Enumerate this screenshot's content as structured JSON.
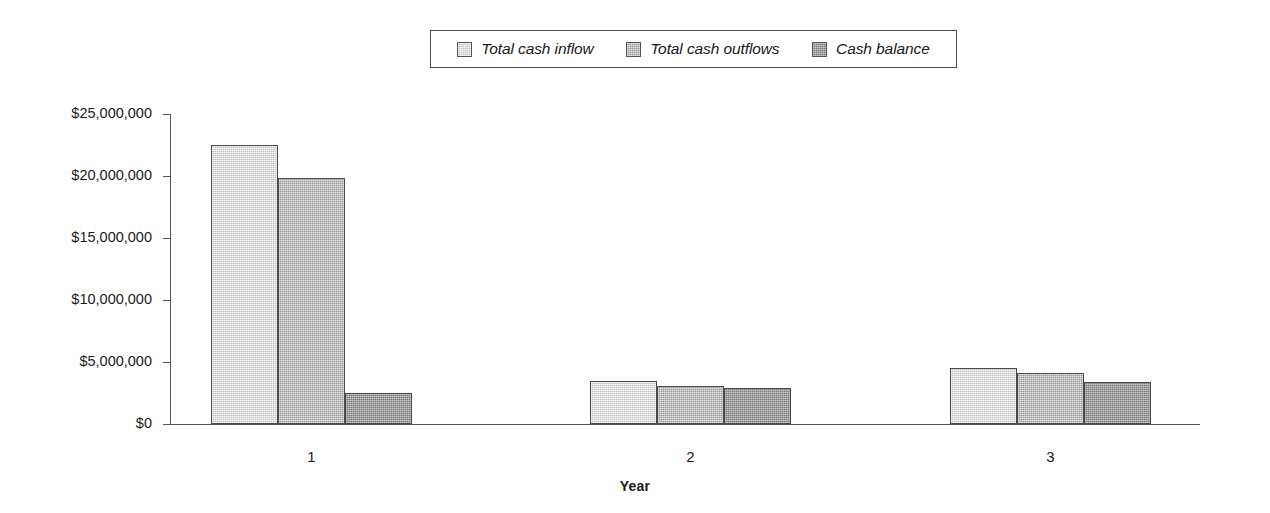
{
  "chart_data": {
    "type": "bar",
    "title": "",
    "xlabel": "Year",
    "ylabel": "",
    "categories": [
      "1",
      "2",
      "3"
    ],
    "series": [
      {
        "name": "Total cash inflow",
        "color": "#d5d5d5",
        "values": [
          22500000,
          3500000,
          4500000
        ]
      },
      {
        "name": "Total cash outflows",
        "color": "#b1b1b1",
        "values": [
          19800000,
          3100000,
          4100000
        ]
      },
      {
        "name": "Cash balance",
        "color": "#909090",
        "values": [
          2500000,
          2900000,
          3400000
        ]
      }
    ],
    "ylim": [
      0,
      25000000
    ],
    "ytick_values": [
      0,
      5000000,
      10000000,
      15000000,
      20000000,
      25000000
    ],
    "ytick_labels": [
      "$0",
      "$5,000,000",
      "$10,000,000",
      "$15,000,000",
      "$20,000,000",
      "$25,000,000"
    ],
    "grid": false,
    "legend_position": "top-center",
    "legend_border": true,
    "axis_color": "#555555",
    "bar_border_color": "#4a4a4a"
  },
  "legend": {
    "entries": [
      {
        "label": "Total cash inflow"
      },
      {
        "label": "Total cash outflows"
      },
      {
        "label": "Cash balance"
      }
    ]
  },
  "axes": {
    "x_title": "Year",
    "category_labels": [
      "1",
      "2",
      "3"
    ],
    "y_labels": [
      "$25,000,000",
      "$20,000,000",
      "$15,000,000",
      "$10,000,000",
      "$5,000,000",
      "$0"
    ]
  }
}
